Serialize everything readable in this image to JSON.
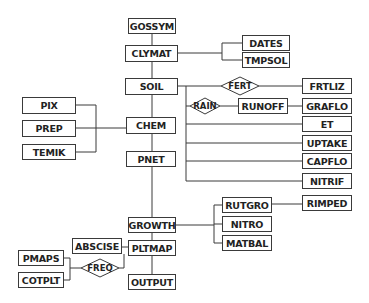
{
  "diagram": {
    "modules": {
      "gossym": "GOSSYM",
      "clymat": "CLYMAT",
      "dates": "DATES",
      "tmpsol": "TMPSOL",
      "soil": "SOIL",
      "frtliz": "FRTLIZ",
      "runoff": "RUNOFF",
      "graflo": "GRAFLO",
      "et": "ET",
      "uptake": "UPTAKE",
      "capflo": "CAPFLO",
      "nitrif": "NITRIF",
      "pix": "PIX",
      "prep": "PREP",
      "temik": "TEMIK",
      "chem": "CHEM",
      "pnet": "PNET",
      "growth": "GROWTH",
      "rutgro": "RUTGRO",
      "rimped": "RIMPED",
      "nitro": "NITRO",
      "matbal": "MATBAL",
      "abscise": "ABSCISE",
      "pltmap": "PLTMAP",
      "pmaps": "PMAPS",
      "cotplt": "COTPLT",
      "output": "OUTPUT"
    },
    "conditions": {
      "fert": "FERT",
      "rain": "RAIN",
      "freq": "FREQ"
    },
    "colors": {
      "line": "#3a3a3a",
      "box_border": "#3a3a3a",
      "text": "#222222",
      "background": "#ffffff"
    }
  }
}
